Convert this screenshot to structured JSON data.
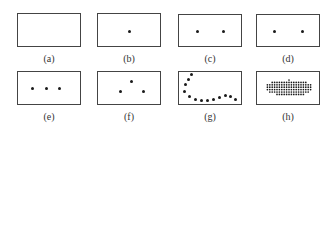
{
  "figure": {
    "panels": [
      {
        "id": "a",
        "label": "(a)",
        "box": [
          17,
          13,
          64,
          34
        ],
        "dots": []
      },
      {
        "id": "b",
        "label": "(b)",
        "box": [
          97,
          13,
          64,
          34
        ],
        "dots": [
          [
            129,
            31
          ]
        ]
      },
      {
        "id": "c",
        "label": "(c)",
        "box": [
          178,
          14,
          64,
          33
        ],
        "dots": [
          [
            197,
            31
          ],
          [
            223,
            31
          ]
        ]
      },
      {
        "id": "d",
        "label": "(d)",
        "box": [
          256,
          14,
          64,
          33
        ],
        "dots": [
          [
            274,
            31
          ],
          [
            302,
            31
          ]
        ]
      },
      {
        "id": "e",
        "label": "(e)",
        "box": [
          17,
          71,
          64,
          34
        ],
        "dots": [
          [
            32,
            88
          ],
          [
            46,
            88
          ],
          [
            59,
            88
          ]
        ]
      },
      {
        "id": "f",
        "label": "(f)",
        "box": [
          97,
          71,
          64,
          34
        ],
        "dots": [
          [
            131,
            81
          ],
          [
            120,
            91
          ],
          [
            143,
            91
          ]
        ]
      },
      {
        "id": "g",
        "label": "(g)",
        "box": [
          178,
          71,
          64,
          34
        ],
        "dots": [
          [
            191,
            74
          ],
          [
            188,
            79
          ],
          [
            185,
            84
          ],
          [
            184,
            91
          ],
          [
            189,
            96
          ],
          [
            195,
            99
          ],
          [
            201,
            100
          ],
          [
            207,
            100
          ],
          [
            213,
            99
          ],
          [
            219,
            97
          ],
          [
            225,
            95
          ],
          [
            230,
            96
          ],
          [
            235,
            99
          ]
        ]
      },
      {
        "id": "h",
        "label": "(h)",
        "box": [
          256,
          71,
          64,
          34
        ],
        "dots": [],
        "ellipse_grid": {
          "cx": 289,
          "cy": 88,
          "rx": 24,
          "ry": 8,
          "spacing": 2.4
        }
      }
    ],
    "label_positions": {
      "a": [
        49,
        59
      ],
      "b": [
        129,
        59
      ],
      "c": [
        210,
        59
      ],
      "d": [
        288,
        59
      ],
      "e": [
        49,
        117
      ],
      "f": [
        129,
        117
      ],
      "g": [
        210,
        117
      ],
      "h": [
        288,
        117
      ]
    }
  }
}
